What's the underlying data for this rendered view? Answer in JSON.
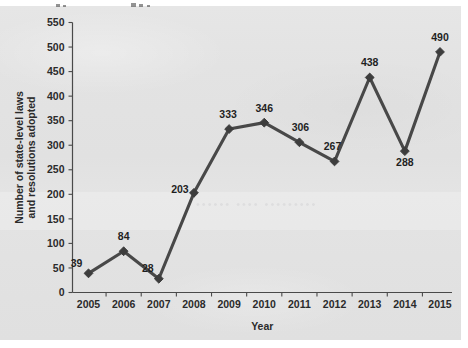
{
  "chart_data": {
    "type": "line",
    "title": "",
    "xlabel": "Year",
    "ylabel": "Number of state-level laws and resolutions adopted",
    "ylabel_line1": "Number of state-level laws",
    "ylabel_line2": "and resolutions adopted",
    "categories": [
      "2005",
      "2006",
      "2007",
      "2008",
      "2009",
      "2010",
      "2011",
      "2012",
      "2013",
      "2014",
      "2015"
    ],
    "values": [
      39,
      84,
      28,
      203,
      333,
      346,
      306,
      267,
      438,
      288,
      490
    ],
    "data_labels": [
      "39",
      "84",
      "28",
      "203",
      "333",
      "346",
      "306",
      "267",
      "438",
      "288",
      "490"
    ],
    "ylim": [
      0,
      550
    ],
    "ytick_step": 50,
    "ytick_labels": [
      "0",
      "50",
      "100",
      "150",
      "200",
      "250",
      "300",
      "350",
      "400",
      "450",
      "500",
      "550"
    ],
    "ytick_values": [
      0,
      50,
      100,
      150,
      200,
      250,
      300,
      350,
      400,
      450,
      500,
      550
    ],
    "grid": false,
    "legend": null,
    "marker": "diamond",
    "series_color": "#484848",
    "axis_color": "#4a4a4a",
    "text_color": "#2b2b2b",
    "background_color": "#e2e2e2"
  },
  "label_offsets": [
    {
      "dx": -12,
      "dy": -6
    },
    {
      "dx": 0,
      "dy": -11
    },
    {
      "dx": -11,
      "dy": -7
    },
    {
      "dx": -14,
      "dy": 0
    },
    {
      "dx": -1,
      "dy": -11
    },
    {
      "dx": 0,
      "dy": -11
    },
    {
      "dx": 1,
      "dy": -11
    },
    {
      "dx": -2,
      "dy": -11
    },
    {
      "dx": 0,
      "dy": -11
    },
    {
      "dx": 0,
      "dy": 15
    },
    {
      "dx": 0,
      "dy": -11
    }
  ],
  "watermark": {
    "text": "•••••• •••• •••••••••"
  }
}
